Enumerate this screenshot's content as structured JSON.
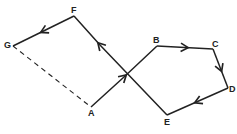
{
  "diagram": {
    "points": {
      "A": {
        "label": "A",
        "x": 91,
        "y": 107
      },
      "B": {
        "label": "B",
        "x": 157,
        "y": 46
      },
      "C": {
        "label": "C",
        "x": 213,
        "y": 49
      },
      "D": {
        "label": "D",
        "x": 228,
        "y": 88
      },
      "E": {
        "label": "E",
        "x": 167,
        "y": 115
      },
      "F": {
        "label": "F",
        "x": 74,
        "y": 16
      },
      "G": {
        "label": "G",
        "x": 13,
        "y": 46
      }
    },
    "edges": [
      {
        "from": "A",
        "to": "B",
        "style": "solid",
        "arrow": true
      },
      {
        "from": "B",
        "to": "C",
        "style": "solid",
        "arrow": true
      },
      {
        "from": "C",
        "to": "D",
        "style": "solid",
        "arrow": true
      },
      {
        "from": "D",
        "to": "E",
        "style": "solid",
        "arrow": true
      },
      {
        "from": "E",
        "to": "F",
        "style": "solid",
        "arrow": true
      },
      {
        "from": "F",
        "to": "G",
        "style": "solid",
        "arrow": true
      },
      {
        "from": "G",
        "to": "A",
        "style": "dashed",
        "arrow": false
      }
    ],
    "line_color": "#222222"
  }
}
